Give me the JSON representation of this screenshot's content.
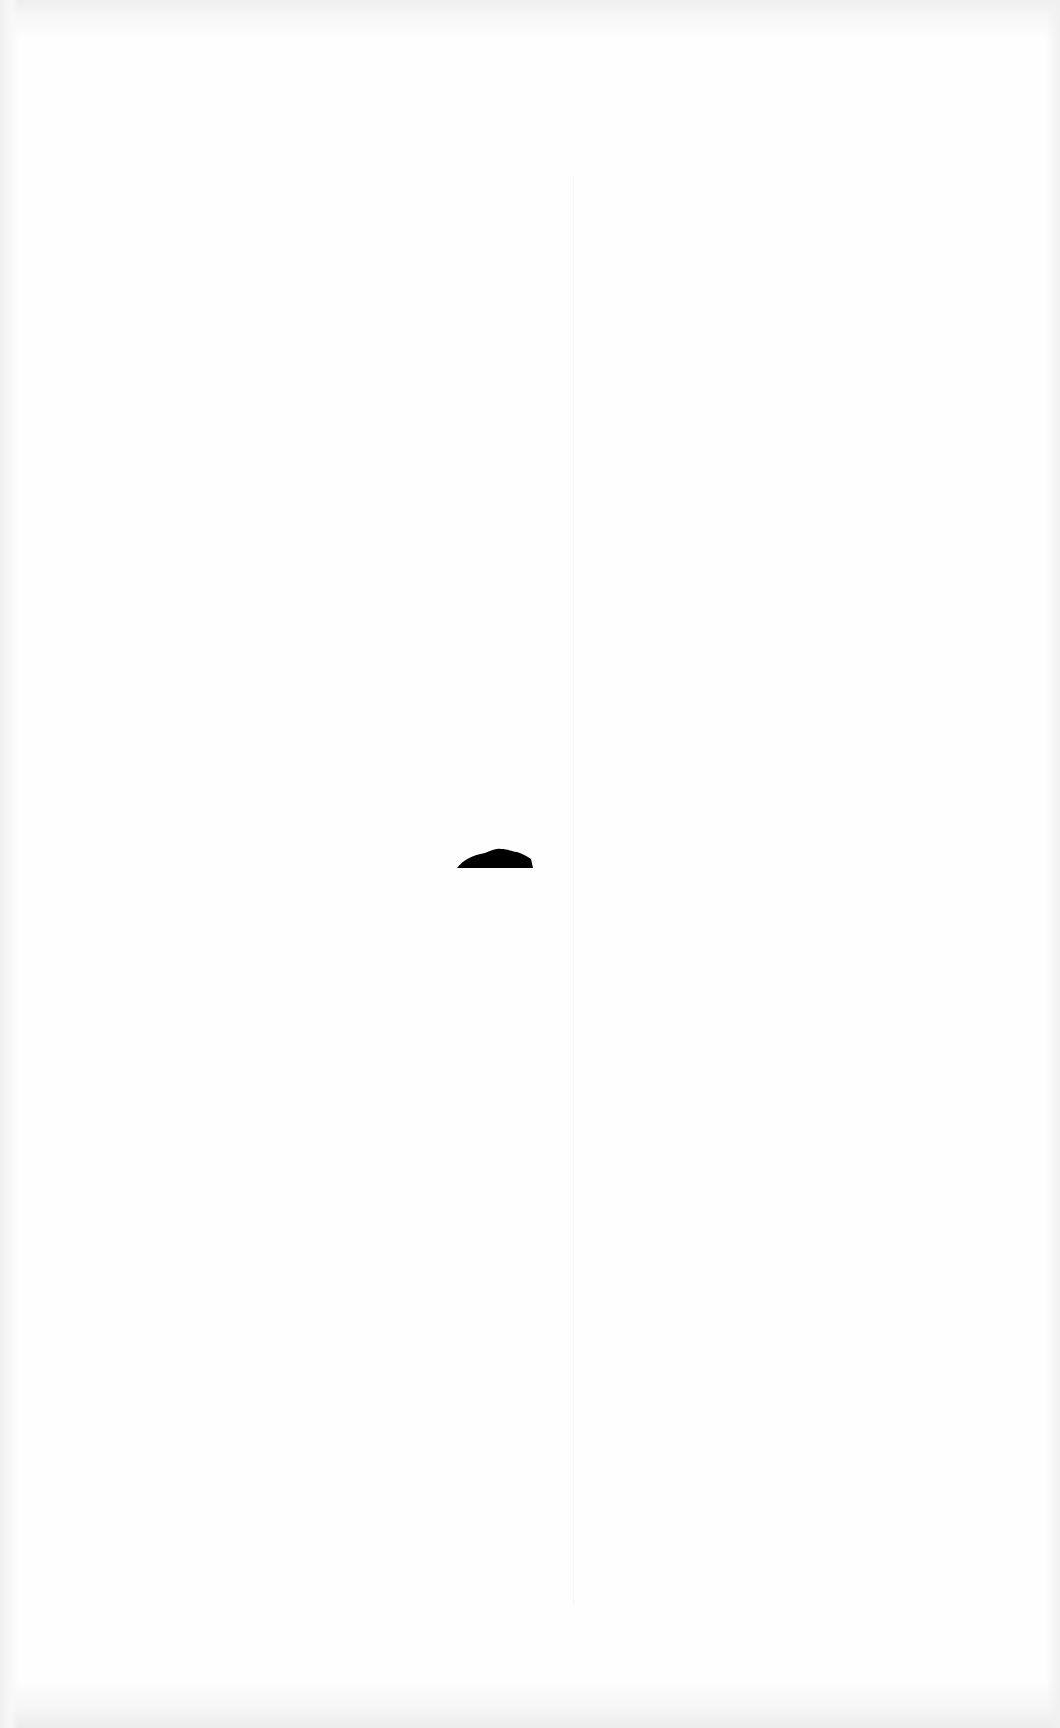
{
  "document": {
    "type": "scanned-page",
    "background_color": "#fefefe",
    "ink_color": "#000000",
    "legibility": "overexposed — text content not readable",
    "faded_text_blocks": [
      {
        "id": "block-1",
        "text": "",
        "x": 575,
        "y": 180
      },
      {
        "id": "block-2",
        "text": "",
        "x": 575,
        "y": 243
      },
      {
        "id": "block-3",
        "text": "",
        "x": 575,
        "y": 355
      },
      {
        "id": "block-4",
        "text": "",
        "x": 760,
        "y": 1300
      }
    ],
    "marks": [
      {
        "id": "ink-blot",
        "shape": "dome",
        "x": 455,
        "y": 846,
        "width": 80,
        "height": 24
      }
    ]
  }
}
